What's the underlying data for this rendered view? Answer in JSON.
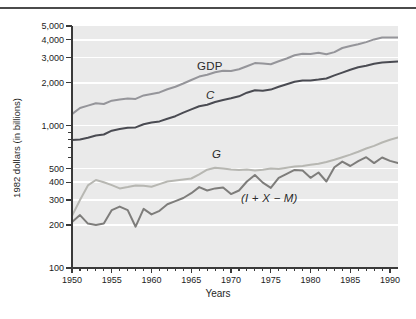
{
  "chart_data": {
    "type": "line",
    "title": "",
    "xlabel": "Years",
    "ylabel": "1982 dollars (in billions)",
    "y_scale": "log",
    "xlim": [
      1950,
      1991
    ],
    "ylim": [
      100,
      5000
    ],
    "x_ticks_labeled": [
      1950,
      1955,
      1960,
      1965,
      1970,
      1975,
      1980,
      1985,
      1990
    ],
    "y_ticks_labeled": [
      100,
      200,
      300,
      400,
      500,
      1000,
      2000,
      3000,
      4000,
      5000
    ],
    "y_ticks_minor": [
      600,
      700,
      800,
      900
    ],
    "grid_values": [
      200,
      300,
      400,
      500,
      1000,
      2000,
      3000,
      4000
    ],
    "grid_on": true,
    "legend_position": "inline-labels",
    "plot_bg": "#eaeaea",
    "grid_color": "#ffffff",
    "axis_color": "#3a3a3a",
    "tick_label_color": "#1c1c1c",
    "years": [
      1950,
      1951,
      1952,
      1953,
      1954,
      1955,
      1956,
      1957,
      1958,
      1959,
      1960,
      1961,
      1962,
      1963,
      1964,
      1965,
      1966,
      1967,
      1968,
      1969,
      1970,
      1971,
      1972,
      1973,
      1974,
      1975,
      1976,
      1977,
      1978,
      1979,
      1980,
      1981,
      1982,
      1983,
      1984,
      1985,
      1986,
      1987,
      1988,
      1989,
      1990,
      1991
    ],
    "series": [
      {
        "name": "GDP",
        "label": "GDP",
        "italic": false,
        "color": "#95959a",
        "values": [
          1204,
          1328,
          1380,
          1435,
          1416,
          1495,
          1526,
          1551,
          1539,
          1629,
          1665,
          1709,
          1799,
          1873,
          1973,
          2088,
          2208,
          2271,
          2366,
          2423,
          2416,
          2485,
          2609,
          2744,
          2729,
          2695,
          2827,
          2959,
          3115,
          3192,
          3187,
          3249,
          3166,
          3279,
          3501,
          3619,
          3718,
          3854,
          4024,
          4144,
          4155,
          4160
        ]
      },
      {
        "name": "C",
        "label": "C",
        "italic": true,
        "color": "#4a4b52",
        "values": [
          790,
          800,
          821,
          852,
          866,
          921,
          946,
          965,
          971,
          1021,
          1050,
          1070,
          1118,
          1163,
          1232,
          1299,
          1365,
          1398,
          1464,
          1511,
          1554,
          1606,
          1700,
          1771,
          1756,
          1789,
          1871,
          1950,
          2028,
          2076,
          2073,
          2103,
          2139,
          2250,
          2354,
          2469,
          2564,
          2633,
          2718,
          2773,
          2800,
          2820
        ]
      },
      {
        "name": "G",
        "label": "G",
        "italic": true,
        "color": "#b7b7b2",
        "values": [
          232,
          300,
          380,
          415,
          400,
          382,
          362,
          370,
          380,
          378,
          372,
          388,
          405,
          412,
          418,
          425,
          455,
          490,
          505,
          500,
          492,
          487,
          492,
          483,
          490,
          500,
          495,
          505,
          515,
          520,
          530,
          540,
          555,
          575,
          600,
          625,
          655,
          690,
          720,
          760,
          795,
          825
        ]
      },
      {
        "name": "I+X-M",
        "label": "(I + X − M)",
        "italic": true,
        "color": "#7e7d7b",
        "values": [
          210,
          235,
          205,
          200,
          205,
          255,
          270,
          255,
          195,
          260,
          238,
          252,
          280,
          295,
          310,
          335,
          370,
          350,
          362,
          368,
          330,
          350,
          405,
          450,
          398,
          365,
          430,
          458,
          488,
          483,
          430,
          468,
          405,
          510,
          558,
          520,
          563,
          600,
          545,
          597,
          565,
          545
        ]
      }
    ]
  }
}
